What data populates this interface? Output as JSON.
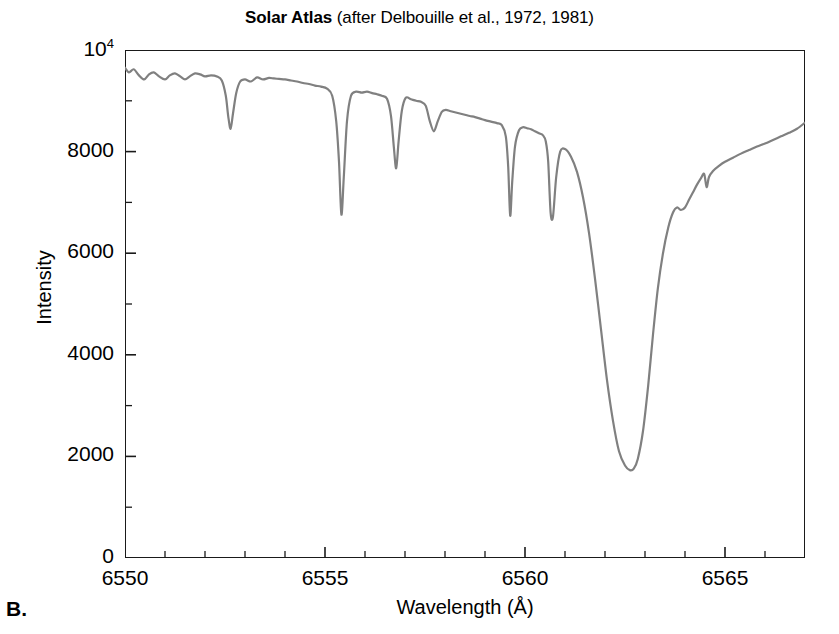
{
  "figure": {
    "panel_label": "B.",
    "title_main": "Solar Atlas",
    "title_sub": " (after Delbouille et al., 1972, 1981)",
    "line_color": "#808080",
    "axis_color": "#1a1a1a",
    "background_color": "#ffffff"
  },
  "axes": {
    "x": {
      "label": "Wavelength (Å)",
      "ticks": [
        "6550",
        "6555",
        "6560",
        "6565"
      ],
      "tick_values": [
        6550,
        6555,
        6560,
        6565
      ],
      "minor_step": 1,
      "range": [
        6550,
        6567
      ]
    },
    "y": {
      "label": "Intensity",
      "ticks": [
        "0",
        "2000",
        "4000",
        "6000",
        "8000",
        "10<sup>4</sup>"
      ],
      "tick_values": [
        0,
        2000,
        4000,
        6000,
        8000,
        10000
      ],
      "range": [
        0,
        10000
      ]
    }
  },
  "chart_data": {
    "type": "line",
    "title": "Solar Atlas (after Delbouille et al., 1972, 1981)",
    "subtitle": "",
    "xlabel": "Wavelength (Å)",
    "ylabel": "Intensity",
    "xlim": [
      6550,
      6567
    ],
    "ylim": [
      0,
      10000
    ],
    "grid": false,
    "legend": "none",
    "series": [
      {
        "name": "Solar spectrum (H-alpha region)",
        "color": "#808080",
        "x": [
          6550.0,
          6550.1,
          6550.22,
          6550.35,
          6550.48,
          6550.6,
          6550.72,
          6550.85,
          6551.0,
          6551.12,
          6551.25,
          6551.38,
          6551.5,
          6551.62,
          6551.75,
          6551.88,
          6552.0,
          6552.15,
          6552.3,
          6552.42,
          6552.52,
          6552.58,
          6552.64,
          6552.7,
          6552.78,
          6552.88,
          6553.0,
          6553.15,
          6553.3,
          6553.45,
          6553.6,
          6553.72,
          6553.85,
          6554.0,
          6554.15,
          6554.3,
          6554.45,
          6554.6,
          6554.75,
          6554.9,
          6555.05,
          6555.18,
          6555.28,
          6555.35,
          6555.41,
          6555.47,
          6555.55,
          6555.65,
          6555.78,
          6555.92,
          6556.05,
          6556.18,
          6556.3,
          6556.42,
          6556.55,
          6556.65,
          6556.72,
          6556.78,
          6556.84,
          6556.92,
          6557.02,
          6557.15,
          6557.28,
          6557.4,
          6557.52,
          6557.62,
          6557.72,
          6557.82,
          6557.92,
          6558.02,
          6558.12,
          6558.22,
          6558.32,
          6558.42,
          6558.52,
          6558.62,
          6558.75,
          6558.88,
          6559.0,
          6559.15,
          6559.3,
          6559.42,
          6559.52,
          6559.58,
          6559.63,
          6559.68,
          6559.75,
          6559.85,
          6559.95,
          6560.05,
          6560.15,
          6560.25,
          6560.35,
          6560.45,
          6560.52,
          6560.58,
          6560.64,
          6560.7,
          6560.78,
          6560.88,
          6561.0,
          6561.15,
          6561.3,
          6561.45,
          6561.6,
          6561.75,
          6561.9,
          6562.05,
          6562.2,
          6562.35,
          6562.5,
          6562.62,
          6562.72,
          6562.82,
          6562.95,
          6563.08,
          6563.2,
          6563.32,
          6563.45,
          6563.58,
          6563.7,
          6563.8,
          6563.9,
          6564.0,
          6564.1,
          6564.2,
          6564.3,
          6564.4,
          6564.48,
          6564.54,
          6564.6,
          6564.7,
          6564.85,
          6565.0,
          6565.2,
          6565.4,
          6565.6,
          6565.8,
          6566.0,
          6566.2,
          6566.4,
          6566.6,
          6566.8,
          6567.0
        ],
        "y": [
          9650,
          9560,
          9620,
          9500,
          9420,
          9520,
          9560,
          9480,
          9420,
          9500,
          9540,
          9480,
          9420,
          9480,
          9540,
          9520,
          9480,
          9500,
          9480,
          9400,
          9100,
          8700,
          8450,
          8750,
          9150,
          9380,
          9420,
          9380,
          9460,
          9420,
          9450,
          9440,
          9430,
          9420,
          9400,
          9380,
          9350,
          9330,
          9300,
          9280,
          9240,
          9100,
          8600,
          7800,
          6760,
          7500,
          8600,
          9100,
          9180,
          9160,
          9180,
          9150,
          9130,
          9100,
          9040,
          8700,
          8100,
          7670,
          8200,
          8800,
          9060,
          9030,
          9000,
          8980,
          8900,
          8600,
          8400,
          8600,
          8780,
          8820,
          8800,
          8780,
          8760,
          8740,
          8720,
          8700,
          8680,
          8650,
          8620,
          8590,
          8560,
          8520,
          8300,
          7700,
          6740,
          7400,
          8100,
          8420,
          8480,
          8460,
          8440,
          8400,
          8360,
          8320,
          8200,
          7800,
          6800,
          6720,
          7500,
          8000,
          8050,
          7900,
          7600,
          7100,
          6400,
          5500,
          4500,
          3500,
          2700,
          2100,
          1820,
          1730,
          1760,
          1950,
          2500,
          3400,
          4400,
          5300,
          6000,
          6500,
          6800,
          6900,
          6850,
          6900,
          7050,
          7200,
          7350,
          7480,
          7560,
          7300,
          7500,
          7620,
          7720,
          7800,
          7880,
          7960,
          8030,
          8100,
          8160,
          8230,
          8300,
          8370,
          8450,
          8570
        ]
      }
    ],
    "annotations": [
      {
        "label": "H-alpha core",
        "x": 6562.72,
        "y": 1730
      }
    ]
  }
}
